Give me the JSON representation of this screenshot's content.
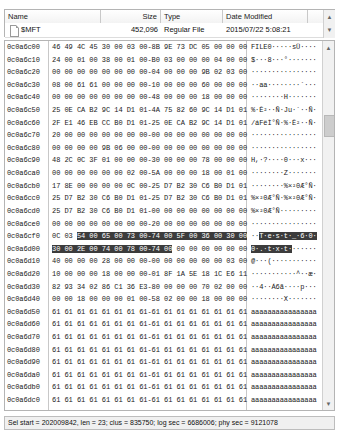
{
  "filelist": {
    "columns": [
      "Name",
      "Size",
      "Type",
      "Date Modified",
      ""
    ],
    "row": {
      "name": "$MFT",
      "size": "452,096",
      "type": "Regular File",
      "date": "2015/07/22 5:08:21"
    },
    "scroll_up_icon": "▲",
    "scroll_down_icon": "▼"
  },
  "hex": {
    "scroll_up_icon": "▲",
    "scroll_down_icon": "▼",
    "rows": [
      {
        "offset": "0c0a6c00",
        "bytes": "46 49 4C 45 30 00 03 00-8B 9E 73 DC 05 00 00 00",
        "ascii": "FILE0·····sÜ····"
      },
      {
        "offset": "0c0a6c10",
        "bytes": "24 00 01 00 38 00 01 00-B0 03 00 00 00 04 00 00",
        "ascii": "$···8···°·······"
      },
      {
        "offset": "0c0a6c20",
        "bytes": "00 00 00 00 00 00 00 00-04 00 00 00 9B 02 03 00",
        "ascii": "················"
      },
      {
        "offset": "0c0a6c30",
        "bytes": "08 00 61 61 00 00 00 00-10 00 00 00 60 00 00 00",
        "ascii": "··aa········`···"
      },
      {
        "offset": "0c0a6c40",
        "bytes": "00 00 00 00 00 00 00 00-48 00 00 00 18 00 00 00",
        "ascii": "········H·······"
      },
      {
        "offset": "0c0a6c50",
        "bytes": "25 0E CA B2 9C 14 D1 01-4A 75 82 60 9C 14 D1 01",
        "ascii": "%·Ê²··Ñ·Ju·`··Ñ·"
      },
      {
        "offset": "0c0a6c60",
        "bytes": "2F E1 46 EB CC B0 D1 01-25 0E CA B2 9C 14 D1 01",
        "ascii": "/áFëÌ°Ñ·%·Ê²··Ñ·"
      },
      {
        "offset": "0c0a6c70",
        "bytes": "20 00 00 00 00 00 00 00-00 00 00 00 00 00 00 00",
        "ascii": "················"
      },
      {
        "offset": "0c0a6c80",
        "bytes": "00 00 00 00 9B 06 00 00-00 00 00 00 00 00 00 00",
        "ascii": "················"
      },
      {
        "offset": "0c0a6c90",
        "bytes": "48 2C 0C 3F 01 00 00 00-30 00 00 00 78 00 00 00",
        "ascii": "H,·?····0···x···"
      },
      {
        "offset": "0c0a6ca0",
        "bytes": "00 00 00 00 00 00 02 00-5A 00 00 00 18 00 01 00",
        "ascii": "········Z·······"
      },
      {
        "offset": "0c0a6cb0",
        "bytes": "17 8E 00 00 00 00 0C 00-25 D7 B2 30 C6 B0 D1 01",
        "ascii": "········%×²0Æ°Ñ·"
      },
      {
        "offset": "0c0a6cc0",
        "bytes": "25 D7 B2 30 C6 B0 D1 01-25 D7 B2 30 C6 B0 D1 01",
        "ascii": "%×²0Æ°Ñ·%×²0Æ°Ñ·"
      },
      {
        "offset": "0c0a6cd0",
        "bytes": "25 D7 B2 30 C6 B0 D1 01-00 00 00 00 00 00 00 00",
        "ascii": "%×²0Æ°Ñ·········"
      },
      {
        "offset": "0c0a6ce0",
        "bytes": "00 00 00 00 00 00 00 00-20 00 00 00 00 00 00 00",
        "ascii": "················"
      },
      {
        "offset": "0c0a6cf0",
        "bytes": "0C 03 ",
        "bytes_sel": "54 00 65 00 73 00-74 00 5F 00 36 00 30 00",
        "ascii": "··",
        "ascii_sel": "T·e·s·t·_·6·0·"
      },
      {
        "offset": "0c0a6d00",
        "bytes_sel": "30 00 2E 00 74 00 78 00-74 00",
        "bytes": " 00 00 00 00 00 00",
        "ascii_sel": "0·.·t·x·t·",
        "ascii": "······"
      },
      {
        "offset": "0c0a6d10",
        "bytes": "40 00 00 00 28 00 00 00-00 00 00 00 00 00 03 00",
        "ascii": "@···(···········"
      },
      {
        "offset": "0c0a6d20",
        "bytes": "10 00 00 00 18 00 00 00-01 8F 1A 5E 18 1C E6 11",
        "ascii": "···········^··æ·"
      },
      {
        "offset": "0c0a6d30",
        "bytes": "82 93 34 02 86 C1 36 E3-80 00 00 00 70 02 00 00",
        "ascii": "··4··Á6ã····p···"
      },
      {
        "offset": "0c0a6d40",
        "bytes": "00 00 18 00 00 00 01 00-58 02 00 00 18 00 00 00",
        "ascii": "········X·······"
      },
      {
        "offset": "0c0a6d50",
        "bytes": "61 61 61 61 61 61 61 61-61 61 61 61 61 61 61 61",
        "ascii": "aaaaaaaaaaaaaaaa"
      },
      {
        "offset": "0c0a6d60",
        "bytes": "61 61 61 61 61 61 61 61-61 61 61 61 61 61 61 61",
        "ascii": "aaaaaaaaaaaaaaaa"
      },
      {
        "offset": "0c0a6d70",
        "bytes": "61 61 61 61 61 61 61 61-61 61 61 61 61 61 61 61",
        "ascii": "aaaaaaaaaaaaaaaa"
      },
      {
        "offset": "0c0a6d80",
        "bytes": "61 61 61 61 61 61 61 61-61 61 61 61 61 61 61 61",
        "ascii": "aaaaaaaaaaaaaaaa"
      },
      {
        "offset": "0c0a6d90",
        "bytes": "61 61 61 61 61 61 61 61-61 61 61 61 61 61 61 61",
        "ascii": "aaaaaaaaaaaaaaaa"
      },
      {
        "offset": "0c0a6da0",
        "bytes": "61 61 61 61 61 61 61 61-61 61 61 61 61 61 61 61",
        "ascii": "aaaaaaaaaaaaaaaa"
      },
      {
        "offset": "0c0a6db0",
        "bytes": "61 61 61 61 61 61 61 61-61 61 61 61 61 61 61 61",
        "ascii": "aaaaaaaaaaaaaaaa"
      },
      {
        "offset": "0c0a6dc0",
        "bytes": "61 61 61 61 61 61 61 61-61 61 61 61 61 61 61 61",
        "ascii": "aaaaaaaaaaaaaaaa"
      },
      {
        "offset": "0c0a6dd0",
        "bytes": "61 61 61 61 61 61 61 61-61 61 61 61 61 61 61 61",
        "ascii": "aaaaaaaaaaaaaaaa"
      },
      {
        "offset": "0c0a6de0",
        "bytes": "61 61 61 61 61 61 61 61-61 61 61 61 61 61 61 61",
        "ascii": "aaaaaaaaaaaaaaaa"
      },
      {
        "offset": "0c0a6df0",
        "bytes": "61 61 61 61 61 61 61 61-61 61 61 61 61 61 61 61",
        "ascii": "aaaaaaaaaaaaaaaa"
      },
      {
        "offset": "0c0a6e00",
        "bytes": "61 61 61 61 61 61 61 61-61 61 61 61 61 61 61 61",
        "ascii": "aaaaaaaaaaaaaaaa"
      },
      {
        "offset": "0c0a6e10",
        "bytes": "61 61 61 61 61 61 61 61-61 61 61 61 61 61 61 61",
        "ascii": "aaaaaaaaaaaaaaaa"
      },
      {
        "offset": "0c0a6e20",
        "bytes": "61 61 61 61 61 61 61 61-61 61 61 61 61 61 61 61",
        "ascii": "aaaaaaaaaaaaaaaa"
      },
      {
        "offset": "0c0a6e30",
        "bytes": "61 61 61 61 61 61 61 61-61 61 61 61 61 61 61 61",
        "ascii": "aaaaaaaaaaaaaaaa"
      },
      {
        "offset": "0c0a6e40",
        "bytes": "61 61 61 61 61 61 61 61-61 61 61 61 61 61 61 61",
        "ascii": "aaaaaaaaaaaaaaaa"
      },
      {
        "offset": "0c0a6e50",
        "bytes": "61 61 61 61 61 61 61 61-61 61 61 61 61 61 61 61",
        "ascii": "aaaaaaaaaaaaaaaa"
      },
      {
        "offset": "0c0a6e60",
        "bytes": "61 61 61 61 61 61 61 61-61 61 61 61 61 61 61 61",
        "ascii": "aaaaaaaaaaaaaaaa"
      },
      {
        "offset": "0c0a6e70",
        "bytes": "61 61 61 61 61 61 61 61-61 61 61 61 61 61 61 61",
        "ascii": "aaaaaaaaaaaaaaaa"
      },
      {
        "offset": "0c0a6e80",
        "bytes": "61 61 61 61 61 61 61 61-61 61 61 61 61 61 61 61",
        "ascii": "aaaaaaaaaaaaaaaa"
      }
    ]
  },
  "statusbar": {
    "text": "Sel start = 202009842, len = 23; clus = 835750; log sec = 6686006; phy sec = 9121078"
  }
}
